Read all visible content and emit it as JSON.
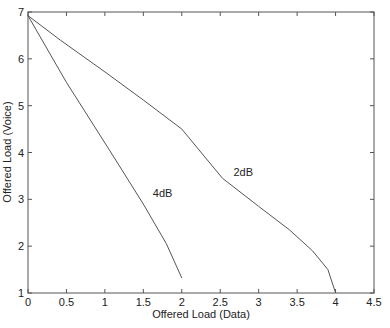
{
  "chart_data": {
    "type": "line",
    "title": "",
    "xlabel": "Offered Load (Data)",
    "ylabel": "Offered Load (Voice)",
    "xlim": [
      0,
      4.5
    ],
    "ylim": [
      1,
      7
    ],
    "xticks": [
      0,
      0.5,
      1,
      1.5,
      2,
      2.5,
      3,
      3.5,
      4,
      4.5
    ],
    "xtick_labels": [
      "0",
      "0.5",
      "1",
      "1.5",
      "2",
      "2.5",
      "3",
      "3.5",
      "4",
      "4.5"
    ],
    "yticks": [
      1,
      2,
      3,
      4,
      5,
      6,
      7
    ],
    "ytick_labels": [
      "1",
      "2",
      "3",
      "4",
      "5",
      "6",
      "7"
    ],
    "grid": false,
    "legend": "none (inline labels)",
    "series": [
      {
        "name": "2dB",
        "label_pos": [
          2.8,
          3.5
        ],
        "x": [
          0,
          0.42,
          1.0,
          1.5,
          2.0,
          2.53,
          3.0,
          3.4,
          3.7,
          3.9,
          4.0
        ],
        "y": [
          6.92,
          6.4,
          5.72,
          5.12,
          4.5,
          3.45,
          2.85,
          2.35,
          1.9,
          1.5,
          1.0
        ]
      },
      {
        "name": "4dB",
        "label_pos": [
          1.75,
          3.05
        ],
        "x": [
          0,
          0.5,
          1.06,
          1.5,
          1.8,
          2.0
        ],
        "y": [
          6.92,
          5.5,
          4.05,
          2.9,
          2.05,
          1.32
        ]
      }
    ]
  },
  "layout": {
    "plot_left": 28,
    "plot_right": 374,
    "plot_top": 12,
    "plot_bottom": 293
  }
}
